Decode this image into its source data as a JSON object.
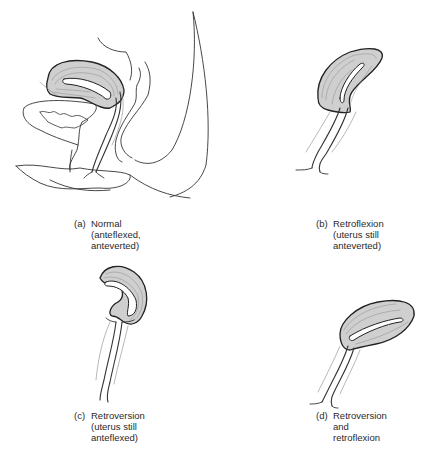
{
  "figure": {
    "panels": [
      {
        "id": "a",
        "tag": "(a)",
        "lines": [
          "Normal",
          "(anteflexed,",
          "anteverted)"
        ]
      },
      {
        "id": "b",
        "tag": "(b)",
        "lines": [
          "Retroflexion",
          "(uterus still",
          "anteverted)"
        ]
      },
      {
        "id": "c",
        "tag": "(c)",
        "lines": [
          "Retroversion",
          "(uterus still",
          "anteflexed)"
        ]
      },
      {
        "id": "d",
        "tag": "(d)",
        "lines": [
          "Retroversion",
          "and",
          "retroflexion"
        ]
      }
    ],
    "colors": {
      "outline": "#222222",
      "uterus_fill": "#cfcfcf",
      "muscle_lines": "#8a8a8a",
      "background": "#ffffff"
    }
  }
}
